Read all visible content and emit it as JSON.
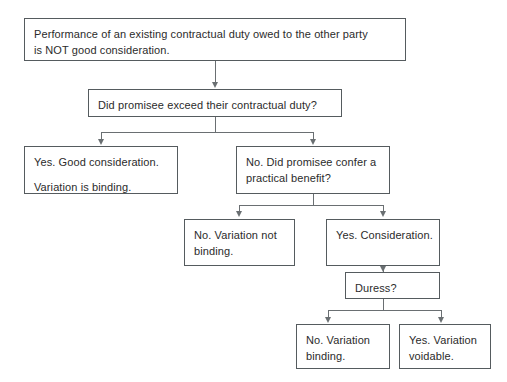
{
  "diagram": {
    "background_color": "#ffffff",
    "line_color": "#6a6f72",
    "box_border_color": "#555b5e",
    "text_color": "#2b2b2b"
  },
  "nodes": {
    "premise": {
      "line1": "Performance of an existing contractual duty owed to the other party",
      "line2": "is NOT good consideration."
    },
    "question_exceed": {
      "line1": "Did promisee exceed their contractual duty?"
    },
    "yes_good_consideration": {
      "line1": "Yes. Good consideration.",
      "line2": "Variation is binding."
    },
    "no_practical_benefit": {
      "line1": "No. Did promisee confer a",
      "line2": "practical benefit?"
    },
    "no_variation_not_binding": {
      "line1": "No. Variation not",
      "line2": "binding."
    },
    "yes_consideration": {
      "line1": "Yes. Consideration."
    },
    "duress": {
      "line1": "Duress?"
    },
    "no_variation_binding": {
      "line1": "No. Variation",
      "line2": "binding."
    },
    "yes_variation_voidable": {
      "line1": "Yes. Variation",
      "line2": "voidable."
    }
  },
  "edges": [
    {
      "name": "premise-to-question",
      "from": "premise",
      "to": "question_exceed",
      "label": ""
    },
    {
      "name": "question-to-yes",
      "from": "question_exceed",
      "to": "yes_good_consideration",
      "label": ""
    },
    {
      "name": "question-to-no",
      "from": "question_exceed",
      "to": "no_practical_benefit",
      "label": ""
    },
    {
      "name": "benefit-to-no",
      "from": "no_practical_benefit",
      "to": "no_variation_not_binding",
      "label": ""
    },
    {
      "name": "benefit-to-yes",
      "from": "no_practical_benefit",
      "to": "yes_consideration",
      "label": ""
    },
    {
      "name": "consideration-to-duress",
      "from": "yes_consideration",
      "to": "duress",
      "label": ""
    },
    {
      "name": "duress-to-no",
      "from": "duress",
      "to": "no_variation_binding",
      "label": ""
    },
    {
      "name": "duress-to-yes",
      "from": "duress",
      "to": "yes_variation_voidable",
      "label": ""
    }
  ]
}
